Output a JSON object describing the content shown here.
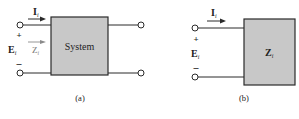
{
  "diagram_a": {
    "caption": "(a)",
    "box_label": "System",
    "current_label": "I",
    "current_sub": "i",
    "voltage_label": "E",
    "voltage_sub": "i",
    "impedance_label": "Z",
    "impedance_sub": "i",
    "plus": "+",
    "minus": "–"
  },
  "diagram_b": {
    "caption": "(b)",
    "box_label": "Z",
    "box_sub": "i",
    "current_label": "I",
    "current_sub": "i",
    "voltage_label": "E",
    "voltage_sub": "i",
    "plus": "+",
    "minus": "–"
  },
  "colors": {
    "box_fill": "#c8c8c8",
    "stroke": "#2a2a2a",
    "arrow_light": "#8a8a8a"
  }
}
